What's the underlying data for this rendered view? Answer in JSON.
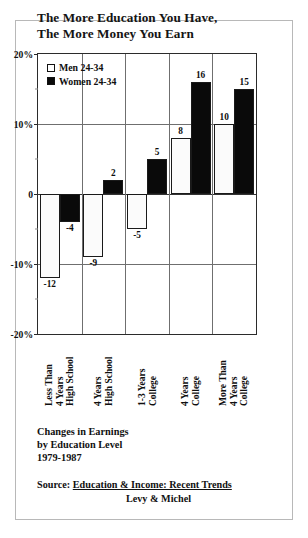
{
  "chart_data": {
    "type": "bar",
    "title": "The More Education You Have, The More Money You Earn",
    "title_lines": [
      "The More Education You Have,",
      "The More Money You Earn"
    ],
    "categories": [
      "Less Than 4 Years High School",
      "4 Years High School",
      "1-3 Years College",
      "4 Years College",
      "More Than 4 Years College"
    ],
    "category_lines": [
      [
        "Less Than",
        "4 Years",
        "High School"
      ],
      [
        "4 Years",
        "High School"
      ],
      [
        "1-3 Years",
        "College"
      ],
      [
        "4 Years",
        "College"
      ],
      [
        "More Than",
        "4 Years",
        "College"
      ]
    ],
    "series": [
      {
        "name": "Men 24-34",
        "values": [
          -12,
          -9,
          -5,
          8,
          10
        ],
        "color": "#ffffff"
      },
      {
        "name": "Women 24-34",
        "values": [
          -4,
          2,
          5,
          16,
          15
        ],
        "color": "#0a0a0a"
      }
    ],
    "value_labels": {
      "men": [
        "-12",
        "-9",
        "-5",
        "8",
        "10"
      ],
      "women": [
        "-4",
        "2",
        "5",
        "16",
        "15"
      ]
    },
    "xlabel": "",
    "ylabel": "",
    "ylim": [
      -20,
      20
    ],
    "y_ticks": [
      20,
      10,
      0,
      -10,
      -20
    ],
    "y_tick_labels": [
      "20%",
      "10%",
      "0",
      "-10%",
      "-20%"
    ],
    "y_minor_ticks": [
      15,
      5,
      -5,
      -15
    ],
    "grid": true,
    "grid_axis": "both",
    "legend_position": "top-left",
    "units": "percent change in earnings"
  },
  "legend": {
    "items": [
      {
        "label": "Men 24-34",
        "swatch": "hollow-square"
      },
      {
        "label": "Women 24-34",
        "swatch": "filled-square"
      }
    ]
  },
  "caption": {
    "line1": "Changes in Earnings",
    "line2": "by Education Level",
    "line3": "1979-1987"
  },
  "source": {
    "prefix": "Source: ",
    "title": "Education & Income:  Recent Trends",
    "authors": "Levy & Michel"
  }
}
